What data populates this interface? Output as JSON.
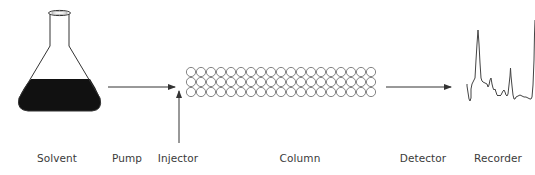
{
  "diagram": {
    "labels": {
      "solvent": "Solvent",
      "pump": "Pump",
      "injector": "Injector",
      "column": "Column",
      "detector": "Detector",
      "recorder": "Recorder"
    },
    "label_positions": {
      "solvent": 57,
      "pump": 127,
      "injector": 178,
      "column": 300,
      "detector": 423,
      "recorder": 498
    },
    "column": {
      "rows": 3,
      "circles_per_row": 19,
      "circle_diameter": 10,
      "x_start": 186,
      "y_start": 67
    },
    "colors": {
      "stroke": "#333333",
      "circle_stroke": "#666666",
      "liquid": "#111111",
      "text": "#3a3a3a"
    }
  }
}
